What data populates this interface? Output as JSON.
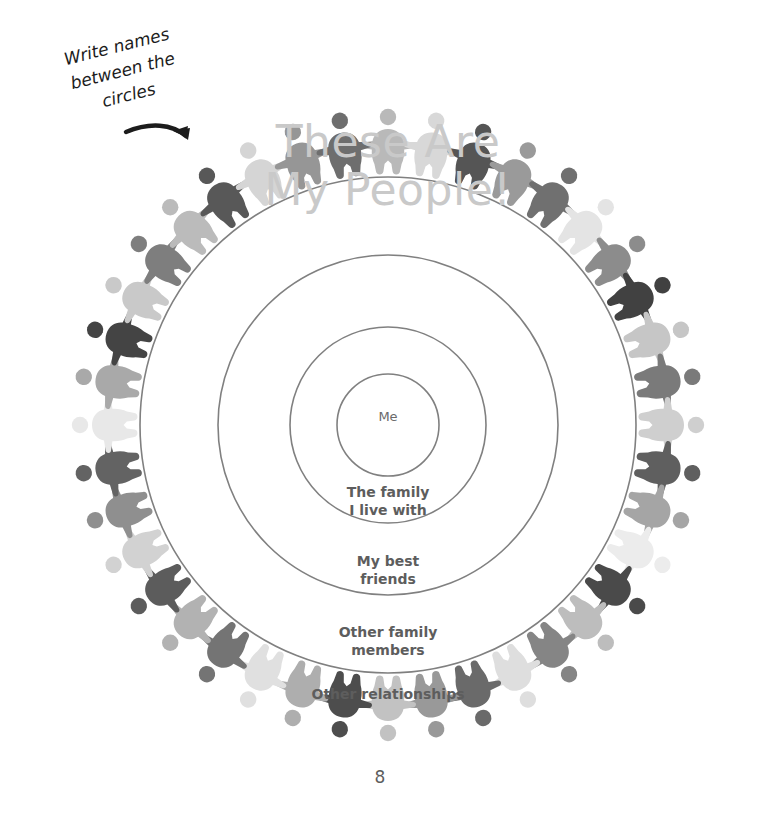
{
  "page": {
    "title_line1": "These Are",
    "title_line2": "My People!",
    "title_color": "#c9c9c9",
    "page_number": "8",
    "background_color": "#ffffff"
  },
  "annotation": {
    "note_text": "Write names\nbetween the\ncircles",
    "note_color": "#1c1c1c",
    "arrow_icon": "curved-arrow-icon"
  },
  "diagram": {
    "type": "concentric-circles",
    "center_x": 388,
    "center_y": 425,
    "stroke_color": "#808080",
    "stroke_width": 1.6,
    "label_color": "#5d5d5d",
    "rings": [
      {
        "key": "me",
        "label": "Me",
        "radius": 51,
        "label_y": 425
      },
      {
        "key": "family",
        "label": "The family\nI live with",
        "radius": 98,
        "label_y": 500
      },
      {
        "key": "friends",
        "label": "My best\nfriends",
        "radius": 170,
        "label_y": 569
      },
      {
        "key": "other_family",
        "label": "Other family\nmembers",
        "radius": 248,
        "label_y": 640
      },
      {
        "key": "other_rel",
        "label": "Other relationships",
        "radius": 0,
        "label_y": 700
      }
    ]
  },
  "figure_ring": {
    "icon": "person-figure-icon",
    "count": 40,
    "angle_step_deg": 9,
    "inner_radius": 252,
    "outer_radius": 318,
    "palette": [
      "#a8a8a8",
      "#cfcfcf",
      "#4f4f4f",
      "#8e8e8e",
      "#6b6b6b",
      "#e0e0e0",
      "#9b9b9b",
      "#3f3f3f",
      "#bdbdbd",
      "#757575",
      "#c4c4c4",
      "#5a5a5a",
      "#a0a0a0",
      "#e6e6e6",
      "#474747",
      "#b5b5b5",
      "#808080",
      "#d6d6d6",
      "#666666",
      "#949494"
    ],
    "shades": [
      "#b9b9b9",
      "#d8d8d8",
      "#555555",
      "#9a9a9a",
      "#707070",
      "#e4e4e4",
      "#8c8c8c",
      "#414141",
      "#c6c6c6",
      "#7a7a7a",
      "#cfcfcf",
      "#5f5f5f",
      "#a5a5a5",
      "#ececec",
      "#4a4a4a",
      "#bdbdbd",
      "#858585",
      "#dedede",
      "#6a6a6a",
      "#999999",
      "#c2c2c2",
      "#4d4d4d",
      "#aeaeae",
      "#e0e0e0",
      "#747474",
      "#b2b2b2",
      "#5c5c5c",
      "#d2d2d2",
      "#8f8f8f",
      "#636363",
      "#e8e8e8",
      "#a9a9a9",
      "#444444",
      "#c9c9c9",
      "#7e7e7e",
      "#bbbbbb",
      "#585858",
      "#d5d5d5",
      "#969696",
      "#6e6e6e"
    ]
  }
}
